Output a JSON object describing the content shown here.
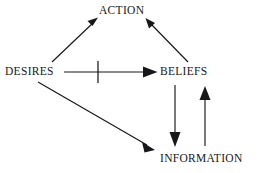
{
  "diagram": {
    "type": "directed-graph",
    "background_color": "#ffffff",
    "stroke_color": "#17171a",
    "nodes": [
      {
        "id": "action",
        "label": "ACTION",
        "x": 124,
        "y": 11
      },
      {
        "id": "desires",
        "label": "DESIRES",
        "x": 33,
        "y": 72
      },
      {
        "id": "beliefs",
        "label": "BELIEFS",
        "x": 186,
        "y": 72
      },
      {
        "id": "information",
        "label": "INFORMATION",
        "x": 200,
        "y": 159
      }
    ],
    "edges": [
      {
        "id": "desires-to-action",
        "from": "desires",
        "to": "action",
        "arrowhead": "filled-triangle",
        "blocked": false
      },
      {
        "id": "beliefs-to-action",
        "from": "beliefs",
        "to": "action",
        "arrowhead": "filled-triangle",
        "blocked": false
      },
      {
        "id": "desires-to-beliefs",
        "from": "desires",
        "to": "beliefs",
        "arrowhead": "filled-triangle",
        "blocked": true
      },
      {
        "id": "desires-to-information",
        "from": "desires",
        "to": "information",
        "arrowhead": "filled-triangle",
        "blocked": false
      },
      {
        "id": "beliefs-to-information",
        "from": "beliefs",
        "to": "information",
        "arrowhead": "filled-triangle",
        "blocked": false
      },
      {
        "id": "information-to-beliefs",
        "from": "information",
        "to": "beliefs",
        "arrowhead": "filled-triangle",
        "blocked": false
      }
    ],
    "annotations": [
      {
        "id": "blocking-tick",
        "kind": "vertical-bar",
        "on_edge": "desires-to-beliefs",
        "x": 98,
        "y": 72
      }
    ]
  }
}
